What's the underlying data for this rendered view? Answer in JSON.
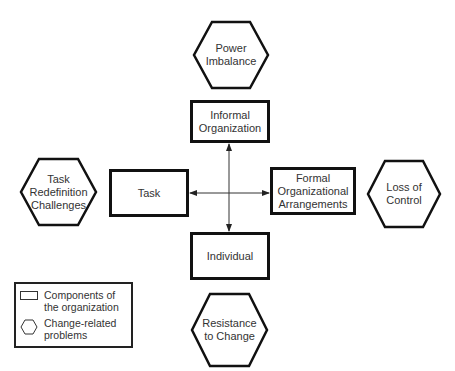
{
  "diagram": {
    "components": {
      "informal": "Informal Organization",
      "task": "Task",
      "formal": "Formal Organizational Arrangements",
      "individual": "Individual"
    },
    "problems": {
      "power": "Power Imbalance",
      "task_redefinition": "Task Redefinition Challenges",
      "loss_of_control": "Loss of Control",
      "resistance": "Resistance to Change"
    },
    "connectors": [
      {
        "from": "Task",
        "to": "Formal Organizational Arrangements",
        "type": "double-arrow"
      },
      {
        "from": "Informal Organization",
        "to": "Individual",
        "type": "double-arrow"
      }
    ]
  },
  "legend": {
    "components_label": "Components of the organization",
    "problems_label": "Change-related problems"
  },
  "colors": {
    "stroke": "#111111",
    "text": "#333333",
    "background": "#ffffff"
  }
}
